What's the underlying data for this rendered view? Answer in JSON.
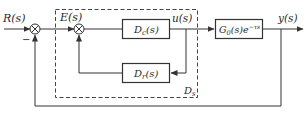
{
  "diagram": {
    "type": "control-block-diagram",
    "signals": {
      "input": "R(s)",
      "error": "E(s)",
      "control": "u(s)",
      "output": "y(s)"
    },
    "minus_sign": "−",
    "blocks": {
      "controller": {
        "name": "D",
        "sub": "c",
        "arg": "(s)"
      },
      "feedback": {
        "name": "D",
        "sub": "r",
        "arg": "(s)"
      },
      "plant": {
        "name": "G",
        "sub": "0",
        "arg": "(s)e",
        "exp": "−τs"
      }
    },
    "group_label": {
      "name": "D",
      "sub": "s"
    },
    "colors": {
      "line": "#333333",
      "dashed": "#444444",
      "background": "#ffffff"
    }
  }
}
